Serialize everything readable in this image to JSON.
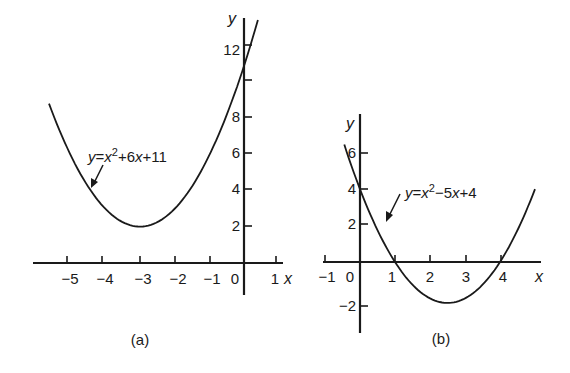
{
  "figure": {
    "panels": [
      {
        "id": "a",
        "caption": "(a)",
        "equation": {
          "prefix": "y",
          "eq": "=",
          "x": "x",
          "sup": "2",
          "rest": "+6",
          "x2": "x",
          "tail": "+11"
        },
        "x_axis_label": "x",
        "y_axis_label": "y",
        "x_ticks": [
          "−5",
          "−4",
          "−3",
          "−2",
          "−1",
          "0",
          "1"
        ],
        "y_ticks": [
          "2",
          "4",
          "6",
          "8",
          "12"
        ]
      },
      {
        "id": "b",
        "caption": "(b)",
        "equation": {
          "prefix": "y",
          "eq": "=",
          "x": "x",
          "sup": "2",
          "rest": "−5",
          "x2": "x",
          "tail": "+4"
        },
        "x_axis_label": "x",
        "y_axis_label": "y",
        "x_ticks": [
          "−1",
          "0",
          "1",
          "2",
          "3",
          "4"
        ],
        "y_ticks": [
          "6",
          "4",
          "2",
          "−2"
        ]
      }
    ]
  },
  "chart_data": [
    {
      "type": "line",
      "title": "(a)",
      "series": [
        {
          "name": "y=x^2+6x+11",
          "function": "x^2+6x+11",
          "x_range": [
            -5.6,
            0.37
          ],
          "vertex": [
            -3,
            2
          ]
        }
      ],
      "xlabel": "x",
      "ylabel": "y",
      "x_ticks": [
        -5,
        -4,
        -3,
        -2,
        -1,
        0,
        1
      ],
      "y_ticks": [
        2,
        4,
        6,
        8,
        10,
        12
      ],
      "xlim": [
        -6,
        1.2
      ],
      "ylim": [
        -1.5,
        13.5
      ],
      "grid": false,
      "annotations": [
        "y=x²+6x+11 with arrow pointing to curve"
      ]
    },
    {
      "type": "line",
      "title": "(b)",
      "series": [
        {
          "name": "y=x^2-5x+4",
          "function": "x^2-5x+4",
          "x_range": [
            -0.45,
            5
          ],
          "vertex": [
            2.5,
            -2.25
          ],
          "roots": [
            1,
            4
          ]
        }
      ],
      "xlabel": "x",
      "ylabel": "y",
      "x_ticks": [
        -1,
        0,
        1,
        2,
        3,
        4
      ],
      "y_ticks": [
        -2,
        2,
        4,
        6
      ],
      "xlim": [
        -1.2,
        5.2
      ],
      "ylim": [
        -4,
        8
      ],
      "grid": false,
      "annotations": [
        "y=x²−5x+4 with arrow pointing to curve"
      ]
    }
  ]
}
